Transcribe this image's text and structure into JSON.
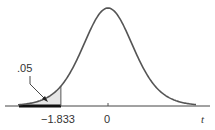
{
  "chart_data": {
    "type": "area",
    "title": "",
    "distribution": "Student t density curve",
    "xlabel": "t",
    "ylabel": "",
    "tick_labels": [
      "-1.833",
      "0"
    ],
    "ticks": [
      -1.833,
      0
    ],
    "shaded_region": {
      "from": "-inf",
      "to": -1.833,
      "area": 0.05,
      "label": ".05"
    },
    "critical_value": -1.833,
    "rejection_region_marker": "thick segment on axis left of -1.833",
    "annotations": [
      {
        "text": ".05",
        "points_to": "shaded left tail"
      }
    ],
    "grid": false,
    "legend": null
  },
  "labels": {
    "tail_area": ".05",
    "critical": "−1.833",
    "zero": "0",
    "axis": "t"
  },
  "colors": {
    "curve": "#555555",
    "shade": "#e6e6e6",
    "axis": "#444444",
    "rejection": "#111111"
  }
}
